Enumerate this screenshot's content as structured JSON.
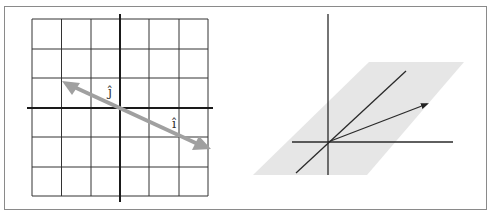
{
  "figure": {
    "left_panel": {
      "description": "2D grid with a single collapsed transformed basis line (i-hat and j-hat land on the same line)",
      "grid": {
        "cols": 6,
        "rows": 6,
        "x0": 32,
        "y0": 19,
        "x1": 208,
        "y1": 196
      },
      "axes_color": "#222222",
      "grid_color": "#333333",
      "vector_color": "#a0a0a0",
      "labels": {
        "i_hat": "î",
        "j_hat": "ĵ"
      }
    },
    "right_panel": {
      "description": "3D axes with a shaded plane containing a line and a vector arrow",
      "plane_color": "#e6e6e6",
      "line_color": "#2a2a2a"
    }
  }
}
